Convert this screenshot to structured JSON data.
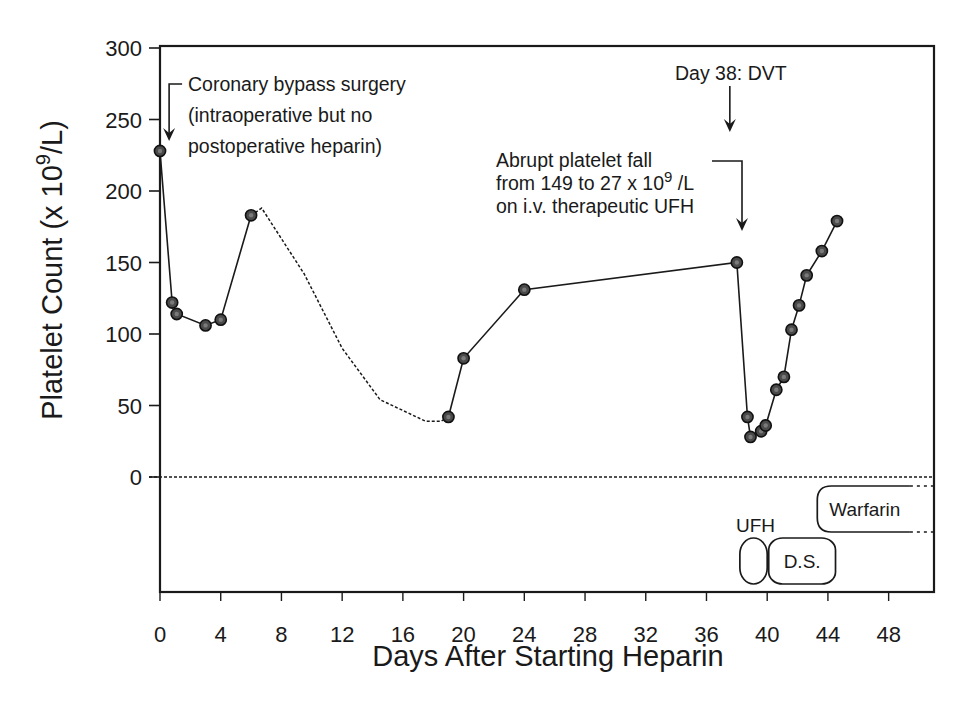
{
  "chart_data": {
    "type": "line",
    "title": "",
    "xlabel": "Days After Starting Heparin",
    "ylabel": "Platelet Count (x 10^9/L)",
    "ylabel_parts": {
      "main": "Platelet Count (x 10",
      "sup": "9",
      "tail": "/L)"
    },
    "xlim": [
      0,
      51
    ],
    "ylim": [
      0,
      300
    ],
    "x_ticks": [
      0,
      4,
      8,
      12,
      16,
      20,
      24,
      28,
      32,
      36,
      40,
      44,
      48
    ],
    "y_ticks": [
      0,
      50,
      100,
      150,
      200,
      250,
      300
    ],
    "grid": false,
    "legend": null,
    "series": [
      {
        "name": "Platelet count (measured)",
        "style": "solid-with-markers",
        "segments": [
          [
            {
              "x": 0,
              "y": 228
            },
            {
              "x": 0.8,
              "y": 122
            },
            {
              "x": 1.1,
              "y": 114
            },
            {
              "x": 3,
              "y": 106
            },
            {
              "x": 4,
              "y": 110
            },
            {
              "x": 6,
              "y": 183
            }
          ],
          [
            {
              "x": 19,
              "y": 42
            },
            {
              "x": 20,
              "y": 83
            },
            {
              "x": 24,
              "y": 131
            },
            {
              "x": 38,
              "y": 150
            },
            {
              "x": 38.7,
              "y": 42
            },
            {
              "x": 38.9,
              "y": 28
            },
            {
              "x": 39.6,
              "y": 32
            },
            {
              "x": 39.9,
              "y": 36
            },
            {
              "x": 40.6,
              "y": 61
            },
            {
              "x": 41.1,
              "y": 70
            },
            {
              "x": 41.6,
              "y": 103
            },
            {
              "x": 42.1,
              "y": 120
            },
            {
              "x": 42.6,
              "y": 141
            },
            {
              "x": 43.6,
              "y": 158
            },
            {
              "x": 44.6,
              "y": 179
            }
          ]
        ]
      },
      {
        "name": "Platelet count (estimated, no data)",
        "style": "dotted",
        "points": [
          {
            "x": 6,
            "y": 183
          },
          {
            "x": 6.7,
            "y": 188
          },
          {
            "x": 9.5,
            "y": 142
          },
          {
            "x": 12,
            "y": 90
          },
          {
            "x": 14.5,
            "y": 54
          },
          {
            "x": 17.5,
            "y": 39
          },
          {
            "x": 18.5,
            "y": 39
          },
          {
            "x": 19,
            "y": 42
          }
        ]
      }
    ],
    "reference_lines": [
      {
        "axis": "y",
        "value": 0,
        "style": "dotted"
      }
    ],
    "annotations": [
      {
        "id": "surgery",
        "lines": [
          "Coronary bypass surgery",
          "(intraoperative but no",
          "postoperative heparin)"
        ],
        "arrow_to_day": 0.6
      },
      {
        "id": "dvt",
        "lines": [
          "Day 38: DVT"
        ],
        "arrow_to_day": 38
      },
      {
        "id": "fall",
        "lines": [
          "Abrupt platelet fall",
          "from 149 to 27 x 10",
          "on i.v. therapeutic UFH"
        ],
        "sup": "9",
        "sup_tail": " /L",
        "arrow_to_day": 38.6
      }
    ],
    "therapies": [
      {
        "label": "UFH",
        "start_day": 38.2,
        "end_day": 40,
        "row": 2,
        "label_above": true
      },
      {
        "label": "D.S.",
        "start_day": 40.1,
        "end_day": 44.5,
        "row": 2
      },
      {
        "label": "Warfarin",
        "start_day": 43.3,
        "end_day": 49.4,
        "row": 1,
        "continues": true
      }
    ]
  }
}
